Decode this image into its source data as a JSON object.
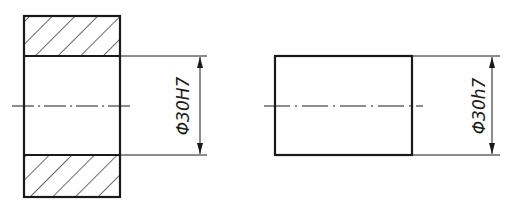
{
  "drawing": {
    "colors": {
      "line": "#1a1a1a",
      "background": "#ffffff"
    },
    "hole_part": {
      "label": "Φ30H7",
      "description": "Sectioned bushing with bore (hole) — hatched walls"
    },
    "shaft_part": {
      "label": "Φ30h7",
      "description": "Shaft view (rectangle) with centerline"
    }
  }
}
